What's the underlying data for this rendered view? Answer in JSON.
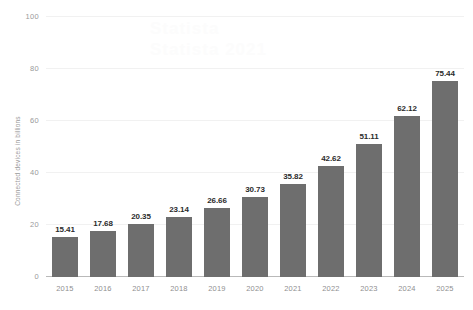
{
  "chart_data": {
    "type": "bar",
    "title": "",
    "xlabel": "",
    "ylabel": "Connected devices in billions",
    "categories": [
      "2015",
      "2016",
      "2017",
      "2018",
      "2019",
      "2020",
      "2021",
      "2022",
      "2023",
      "2024",
      "2025"
    ],
    "values": [
      15.41,
      17.68,
      20.35,
      23.14,
      26.66,
      30.73,
      35.82,
      42.62,
      51.11,
      62.12,
      75.44
    ],
    "value_labels": [
      "15.41",
      "17.68",
      "20.35",
      "23.14",
      "26.66",
      "30.73",
      "35.82",
      "42.62",
      "51.11",
      "62.12",
      "75.44"
    ],
    "ylim": [
      0,
      100
    ],
    "yticks": [
      0,
      20,
      40,
      60,
      80,
      100
    ],
    "ytick_labels": [
      "0",
      "20",
      "40",
      "60",
      "80",
      "100"
    ],
    "grid": true,
    "legend": false,
    "bar_color": "#6e6e6e",
    "value_label_color": "#2b2b2b",
    "gridline_color": "#f1f1f1",
    "axis_text_color": "#9a9a9a",
    "background_color": "#ffffff"
  },
  "watermark": {
    "line1": "Statista",
    "line2": "Statista 2021"
  }
}
